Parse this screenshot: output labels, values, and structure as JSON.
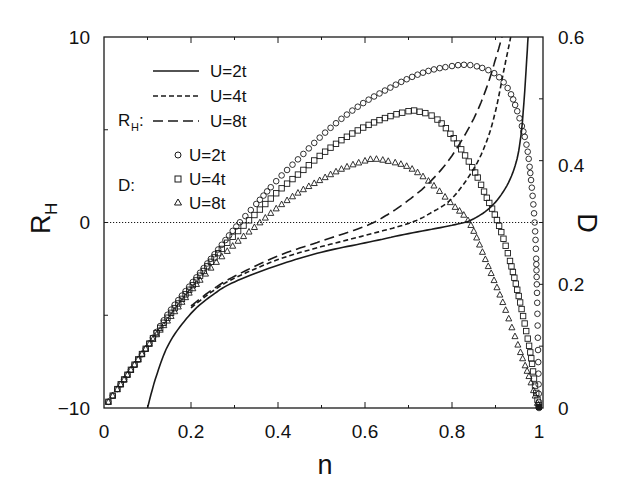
{
  "chart_data": {
    "type": "line",
    "title": "",
    "xlabel": "n",
    "ylabel": "R_H",
    "ylabel_right": "D",
    "xlim": [
      0,
      1
    ],
    "ylim": [
      -10,
      10
    ],
    "ylim_right": [
      0,
      0.6
    ],
    "x_ticks": [
      "0",
      "0.2",
      "0.4",
      "0.6",
      "0.8",
      "1"
    ],
    "y_ticks_left": [
      "-10",
      "0",
      "10"
    ],
    "y_ticks_right": [
      "0",
      "0.2",
      "0.4",
      "0.6"
    ],
    "grid": false,
    "reference_line": {
      "axis": "left",
      "y": 0,
      "style": "dotted"
    },
    "legend": {
      "position": "upper-left",
      "groups": [
        {
          "label": "R_H:",
          "entries": [
            {
              "label": "U=2t",
              "marker": "solid-line"
            },
            {
              "label": "U=4t",
              "marker": "short-dash-line"
            },
            {
              "label": "U=8t",
              "marker": "long-dash-line"
            }
          ]
        },
        {
          "label": "D:",
          "entries": [
            {
              "label": "U=2t",
              "marker": "circle"
            },
            {
              "label": "U=4t",
              "marker": "square"
            },
            {
              "label": "U=8t",
              "marker": "triangle"
            }
          ]
        }
      ]
    },
    "series": [
      {
        "name": "R_H U=2t",
        "axis": "left",
        "style": "solid",
        "x": [
          0.1,
          0.12,
          0.15,
          0.2,
          0.25,
          0.3,
          0.4,
          0.5,
          0.6,
          0.7,
          0.8,
          0.85,
          0.9,
          0.94,
          0.96,
          0.975
        ],
        "y": [
          -10,
          -8.3,
          -6.5,
          -4.9,
          -3.9,
          -3.2,
          -2.3,
          -1.6,
          -1.1,
          -0.6,
          -0.15,
          0.2,
          1.1,
          2.7,
          5.0,
          10
        ]
      },
      {
        "name": "R_H U=4t",
        "axis": "left",
        "style": "short-dash",
        "x": [
          0.2,
          0.25,
          0.3,
          0.4,
          0.5,
          0.6,
          0.7,
          0.75,
          0.8,
          0.85,
          0.88,
          0.9,
          0.92,
          0.935
        ],
        "y": [
          -4.6,
          -3.7,
          -3.0,
          -2.0,
          -1.3,
          -0.7,
          -0.05,
          0.5,
          1.3,
          2.9,
          4.4,
          6.0,
          8.3,
          10
        ]
      },
      {
        "name": "R_H U=8t",
        "axis": "left",
        "style": "long-dash",
        "x": [
          0.2,
          0.25,
          0.3,
          0.4,
          0.5,
          0.6,
          0.65,
          0.7,
          0.75,
          0.8,
          0.85,
          0.88,
          0.9,
          0.915
        ],
        "y": [
          -4.5,
          -3.6,
          -2.9,
          -1.8,
          -1.0,
          -0.2,
          0.4,
          1.2,
          2.2,
          3.6,
          5.6,
          7.3,
          8.8,
          10
        ]
      },
      {
        "name": "D U=2t",
        "axis": "right",
        "style": "circle",
        "x": [
          0.01,
          0.05,
          0.1,
          0.15,
          0.2,
          0.25,
          0.3,
          0.35,
          0.4,
          0.45,
          0.5,
          0.55,
          0.6,
          0.65,
          0.7,
          0.75,
          0.8,
          0.83,
          0.86,
          0.9,
          0.93,
          0.95,
          0.97,
          0.98,
          0.99,
          0.995,
          1.0
        ],
        "y": [
          0.01,
          0.05,
          0.1,
          0.155,
          0.2,
          0.245,
          0.29,
          0.33,
          0.37,
          0.405,
          0.44,
          0.47,
          0.495,
          0.515,
          0.533,
          0.546,
          0.553,
          0.555,
          0.552,
          0.54,
          0.515,
          0.48,
          0.43,
          0.38,
          0.3,
          0.2,
          0.0
        ]
      },
      {
        "name": "D U=4t",
        "axis": "right",
        "style": "square",
        "x": [
          0.01,
          0.05,
          0.1,
          0.15,
          0.2,
          0.25,
          0.3,
          0.35,
          0.4,
          0.45,
          0.5,
          0.55,
          0.6,
          0.65,
          0.7,
          0.72,
          0.76,
          0.8,
          0.85,
          0.88,
          0.9,
          0.92,
          0.94,
          0.96,
          0.98,
          0.99,
          1.0
        ],
        "y": [
          0.01,
          0.05,
          0.1,
          0.15,
          0.195,
          0.24,
          0.28,
          0.315,
          0.35,
          0.38,
          0.41,
          0.435,
          0.455,
          0.47,
          0.48,
          0.48,
          0.47,
          0.44,
          0.385,
          0.34,
          0.31,
          0.27,
          0.22,
          0.16,
          0.09,
          0.04,
          0.0
        ]
      },
      {
        "name": "D U=8t",
        "axis": "right",
        "style": "triangle",
        "x": [
          0.01,
          0.05,
          0.1,
          0.15,
          0.2,
          0.25,
          0.3,
          0.35,
          0.4,
          0.45,
          0.5,
          0.55,
          0.6,
          0.62,
          0.65,
          0.7,
          0.75,
          0.8,
          0.84,
          0.88,
          0.92,
          0.96,
          0.98,
          1.0
        ],
        "y": [
          0.01,
          0.05,
          0.1,
          0.145,
          0.19,
          0.23,
          0.265,
          0.295,
          0.325,
          0.35,
          0.37,
          0.388,
          0.4,
          0.403,
          0.4,
          0.39,
          0.365,
          0.33,
          0.3,
          0.235,
          0.165,
          0.085,
          0.045,
          0.0
        ]
      }
    ]
  },
  "labels": {
    "xlabel": "n",
    "ylabel_left_main": "R",
    "ylabel_left_sub": "H",
    "ylabel_right": "D",
    "legend_rh_main": "R",
    "legend_rh_sub": "H",
    "legend_rh_colon": ":",
    "legend_d": "D:",
    "legend_u2": "U=2t",
    "legend_u4": "U=4t",
    "legend_u8": "U=8t",
    "legend_d_u2": "U=2t",
    "legend_d_u4": "U=4t",
    "legend_d_u8": "U=8t",
    "xtick_0": "0",
    "xtick_02": "0.2",
    "xtick_04": "0.4",
    "xtick_06": "0.6",
    "xtick_08": "0.8",
    "xtick_1": "1",
    "ytick_l_10": "10",
    "ytick_l_0": "0",
    "ytick_l_m10": "−10",
    "ytick_r_06": "0.6",
    "ytick_r_04": "0.4",
    "ytick_r_02": "0.2",
    "ytick_r_0": "0"
  },
  "colors": {
    "ink": "#1a1a1a",
    "background": "#ffffff"
  }
}
